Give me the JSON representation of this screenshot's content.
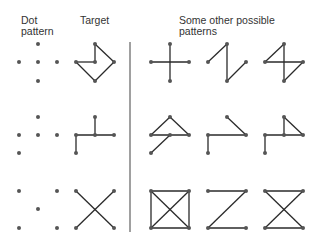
{
  "headers": {
    "dot_pattern": [
      "Dot",
      "pattern"
    ],
    "target": "Target",
    "other": [
      "Some other possible",
      "patterns"
    ]
  },
  "colors": {
    "line": "#2a2a2a",
    "dot": "#555555",
    "divider": "#a0a0a0",
    "text": "#333333"
  },
  "rows": [
    {
      "dots": [
        [
          38,
          44
        ],
        [
          19,
          62
        ],
        [
          38,
          62
        ],
        [
          57,
          62
        ],
        [
          38,
          81
        ]
      ],
      "target": [
        [
          [
            76,
            62
          ],
          [
            95,
            62
          ]
        ],
        [
          [
            95,
            62
          ],
          [
            95,
            44
          ]
        ],
        [
          [
            95,
            44
          ],
          [
            114,
            62
          ]
        ],
        [
          [
            114,
            62
          ],
          [
            95,
            81
          ]
        ],
        [
          [
            95,
            81
          ],
          [
            76,
            62
          ]
        ]
      ],
      "others": [
        [
          [
            [
              151,
              62
            ],
            [
              189,
              62
            ]
          ],
          [
            [
              170,
              44
            ],
            [
              170,
              81
            ]
          ]
        ],
        [
          [
            [
              208,
              62
            ],
            [
              227,
              44
            ]
          ],
          [
            [
              227,
              44
            ],
            [
              227,
              81
            ]
          ],
          [
            [
              227,
              81
            ],
            [
              246,
              62
            ]
          ]
        ],
        [
          [
            [
              265,
              62
            ],
            [
              284,
              44
            ]
          ],
          [
            [
              265,
              62
            ],
            [
              303,
              62
            ]
          ],
          [
            [
              303,
              62
            ],
            [
              284,
              81
            ]
          ],
          [
            [
              284,
              44
            ],
            [
              284,
              81
            ]
          ]
        ]
      ]
    },
    {
      "dots": [
        [
          38,
          117
        ],
        [
          19,
          135
        ],
        [
          38,
          135
        ],
        [
          57,
          135
        ],
        [
          19,
          153
        ]
      ],
      "target": [
        [
          [
            95,
            117
          ],
          [
            95,
            135
          ]
        ],
        [
          [
            76,
            135
          ],
          [
            114,
            135
          ]
        ],
        [
          [
            76,
            135
          ],
          [
            76,
            153
          ]
        ]
      ],
      "others": [
        [
          [
            [
              151,
              135
            ],
            [
              170,
              117
            ]
          ],
          [
            [
              170,
              117
            ],
            [
              189,
              135
            ]
          ],
          [
            [
              151,
              135
            ],
            [
              189,
              135
            ]
          ],
          [
            [
              170,
              135
            ],
            [
              151,
              153
            ]
          ]
        ],
        [
          [
            [
              208,
              135
            ],
            [
              246,
              135
            ]
          ],
          [
            [
              208,
              135
            ],
            [
              208,
              153
            ]
          ],
          [
            [
              227,
              117
            ],
            [
              246,
              135
            ]
          ]
        ],
        [
          [
            [
              265,
              135
            ],
            [
              303,
              135
            ]
          ],
          [
            [
              265,
              135
            ],
            [
              265,
              153
            ]
          ],
          [
            [
              284,
              117
            ],
            [
              284,
              135
            ]
          ],
          [
            [
              284,
              117
            ],
            [
              303,
              135
            ]
          ]
        ]
      ]
    },
    {
      "dots": [
        [
          19,
          191
        ],
        [
          57,
          191
        ],
        [
          38,
          209
        ],
        [
          19,
          228
        ],
        [
          57,
          228
        ]
      ],
      "target": [
        [
          [
            76,
            191
          ],
          [
            114,
            228
          ]
        ],
        [
          [
            114,
            191
          ],
          [
            76,
            228
          ]
        ]
      ],
      "others": [
        [
          [
            [
              151,
              191
            ],
            [
              189,
              191
            ]
          ],
          [
            [
              151,
              228
            ],
            [
              189,
              228
            ]
          ],
          [
            [
              151,
              191
            ],
            [
              151,
              228
            ]
          ],
          [
            [
              189,
              191
            ],
            [
              189,
              228
            ]
          ],
          [
            [
              151,
              191
            ],
            [
              189,
              228
            ]
          ],
          [
            [
              189,
              191
            ],
            [
              151,
              228
            ]
          ]
        ],
        [
          [
            [
              208,
              191
            ],
            [
              246,
              191
            ]
          ],
          [
            [
              246,
              191
            ],
            [
              208,
              228
            ]
          ],
          [
            [
              208,
              228
            ],
            [
              246,
              228
            ]
          ]
        ],
        [
          [
            [
              265,
              191
            ],
            [
              303,
              191
            ]
          ],
          [
            [
              265,
              228
            ],
            [
              303,
              228
            ]
          ],
          [
            [
              265,
              191
            ],
            [
              303,
              228
            ]
          ],
          [
            [
              303,
              191
            ],
            [
              265,
              228
            ]
          ]
        ]
      ]
    }
  ]
}
